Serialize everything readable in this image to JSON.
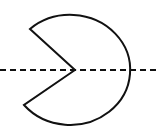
{
  "diagram": {
    "shape": {
      "type": "circle-sector",
      "center": [
        75,
        70
      ],
      "notch_vertex": [
        75,
        70
      ],
      "upper_corner": [
        30,
        29
      ],
      "lower_corner": [
        24,
        105
      ],
      "stroke": "#111111",
      "fill": "#ffffff"
    },
    "axis": {
      "type": "dashed-line",
      "y": 70,
      "x_start": 0,
      "x_end": 160,
      "stroke": "#111111"
    }
  }
}
